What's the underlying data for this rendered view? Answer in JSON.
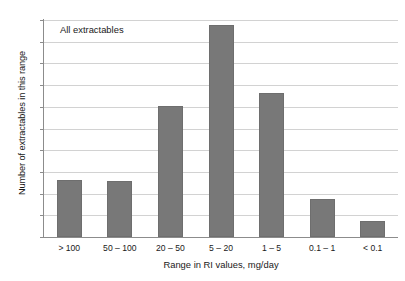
{
  "chart_data": {
    "type": "bar",
    "title": "",
    "xlabel": "Range in RI values, mg/day",
    "ylabel": "Number of extractables in this range",
    "categories": [
      "> 100",
      "50 – 100",
      "20 – 50",
      "5 – 20",
      "1 – 5",
      "0.1 – 1",
      "< 0.1"
    ],
    "values": [
      53,
      52,
      121,
      195,
      133,
      35,
      15
    ],
    "ylim": [
      0,
      200
    ],
    "ytick_labels": [
      "200",
      "180",
      "160",
      "140",
      "120",
      "100",
      "80",
      "60",
      "40",
      "20",
      "0"
    ],
    "ytick_values": [
      200,
      180,
      160,
      140,
      120,
      100,
      80,
      60,
      40,
      20,
      0
    ],
    "grid": "horizontal",
    "legend": "none",
    "annotations": [
      "All extractables"
    ],
    "bar_color": "#787878",
    "grid_color": "#d2d2d2",
    "axis_color": "#8c8c8c"
  },
  "annotation": {
    "text": "All extractables"
  }
}
